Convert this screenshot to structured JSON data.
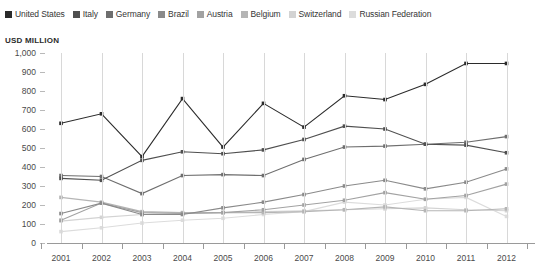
{
  "axis_title": "USD MILLION",
  "legend": {
    "items": [
      {
        "label": "United States",
        "color": "#2b2b2b"
      },
      {
        "label": "Italy",
        "color": "#4f4f4f"
      },
      {
        "label": "Germany",
        "color": "#6e6e6e"
      },
      {
        "label": "Brazil",
        "color": "#8a8a8a"
      },
      {
        "label": "Austria",
        "color": "#a2a2a2"
      },
      {
        "label": "Belgium",
        "color": "#b5b5b5"
      },
      {
        "label": "Switzerland",
        "color": "#d3d3d3"
      },
      {
        "label": "Russian Federation",
        "color": "#dcdcdc"
      }
    ]
  },
  "chart_data": {
    "type": "line",
    "title": "",
    "subtitle": "",
    "xlabel": "",
    "ylabel": "USD MILLION",
    "ylim": [
      0,
      1000
    ],
    "ytick_step": 100,
    "ytick_labels": [
      "1,000",
      "900",
      "800",
      "700",
      "600",
      "500",
      "400",
      "300",
      "200",
      "100",
      "0"
    ],
    "grid": "vertical",
    "legend_position": "top-left",
    "categories": [
      "2001",
      "2002",
      "2003",
      "2004",
      "2005",
      "2006",
      "2007",
      "2008",
      "2009",
      "2010",
      "2011",
      "2012"
    ],
    "series": [
      {
        "name": "United States",
        "color": "#2b2b2b",
        "values": [
          630,
          680,
          455,
          760,
          505,
          735,
          610,
          775,
          755,
          835,
          945,
          945
        ]
      },
      {
        "name": "Italy",
        "color": "#4f4f4f",
        "values": [
          340,
          330,
          435,
          480,
          470,
          490,
          545,
          615,
          600,
          520,
          515,
          475
        ]
      },
      {
        "name": "Germany",
        "color": "#6e6e6e",
        "values": [
          355,
          350,
          260,
          355,
          360,
          355,
          440,
          505,
          510,
          520,
          530,
          560
        ]
      },
      {
        "name": "Brazil",
        "color": "#8a8a8a",
        "values": [
          155,
          210,
          150,
          150,
          185,
          215,
          255,
          300,
          330,
          285,
          320,
          390
        ]
      },
      {
        "name": "Austria",
        "color": "#a2a2a2",
        "values": [
          120,
          210,
          160,
          155,
          160,
          175,
          200,
          225,
          265,
          230,
          250,
          310
        ]
      },
      {
        "name": "Belgium",
        "color": "#b5b5b5",
        "values": [
          240,
          215,
          165,
          160,
          160,
          160,
          165,
          175,
          190,
          170,
          170,
          180
        ]
      },
      {
        "name": "Switzerland",
        "color": "#d3d3d3",
        "values": [
          115,
          135,
          150,
          155,
          160,
          165,
          170,
          175,
          180,
          185,
          175,
          170
        ]
      },
      {
        "name": "Russian Federation",
        "color": "#dcdcdc",
        "values": [
          60,
          80,
          105,
          120,
          130,
          150,
          165,
          215,
          200,
          230,
          240,
          140
        ]
      }
    ]
  }
}
